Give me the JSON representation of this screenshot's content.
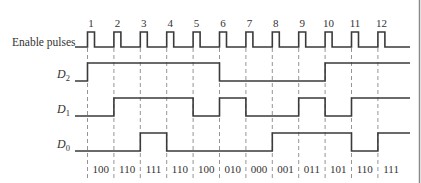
{
  "signals": {
    "enable": {
      "label": "Enable pulses"
    },
    "d2": {
      "label_main": "D",
      "label_sub": "2"
    },
    "d1": {
      "label_main": "D",
      "label_sub": "1"
    },
    "d0": {
      "label_main": "D",
      "label_sub": "0"
    }
  },
  "pulse_numbers": [
    "1",
    "2",
    "3",
    "4",
    "5",
    "6",
    "7",
    "8",
    "9",
    "10",
    "11",
    "12"
  ],
  "initial_state": "000",
  "states": [
    "100",
    "110",
    "111",
    "110",
    "100",
    "010",
    "000",
    "001",
    "011",
    "101",
    "110",
    "111"
  ],
  "colors": {
    "line": "#3a3a3a",
    "dash": "#7a7a7a",
    "text": "#333333",
    "border": "#8a8a8a"
  }
}
